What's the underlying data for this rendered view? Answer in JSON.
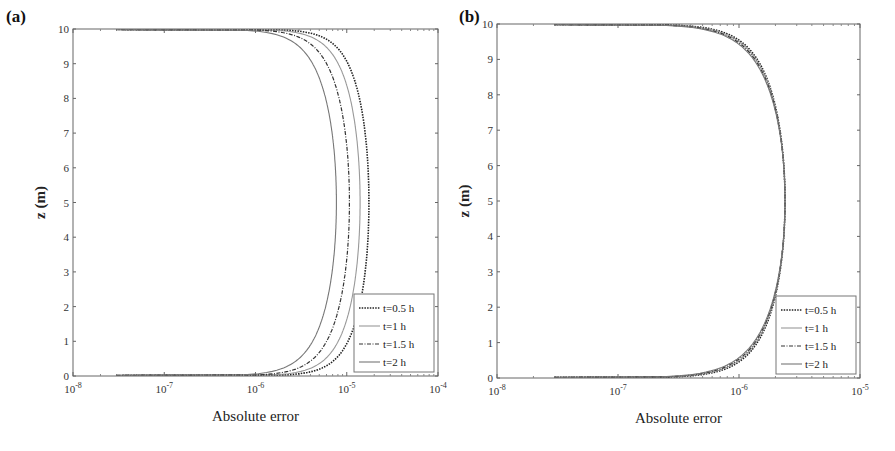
{
  "chart_data": [
    {
      "type": "line",
      "panel_label": "(a)",
      "xlabel": "Absolute error",
      "ylabel": "z (m)",
      "xscale": "log",
      "xlim": [
        1e-08,
        0.0001
      ],
      "ylim": [
        0,
        10
      ],
      "xticks": [
        "10-8",
        "10-7",
        "10-6",
        "10-5",
        "10-4"
      ],
      "yticks": [
        "0",
        "1",
        "2",
        "3",
        "4",
        "5",
        "6",
        "7",
        "8",
        "9",
        "10"
      ],
      "legend_position": "lower right",
      "grid": false,
      "series": [
        {
          "name": "t=0.5 h",
          "style": "dotted",
          "peak_error": 1.75e-05,
          "peak_z": 5
        },
        {
          "name": "t=1 h",
          "style": "solid-light",
          "peak_error": 1.4e-05,
          "peak_z": 5
        },
        {
          "name": "t=1.5 h",
          "style": "dash-dot",
          "peak_error": 1.07e-05,
          "peak_z": 5
        },
        {
          "name": "t=2 h",
          "style": "solid",
          "peak_error": 7.7e-06,
          "peak_z": 5
        }
      ]
    },
    {
      "type": "line",
      "panel_label": "(b)",
      "xlabel": "Absolute error",
      "ylabel": "z (m)",
      "xscale": "log",
      "xlim": [
        1e-08,
        1e-05
      ],
      "ylim": [
        0,
        10
      ],
      "xticks": [
        "10-8",
        "10-7",
        "10-6",
        "10-5"
      ],
      "yticks": [
        "0",
        "1",
        "2",
        "3",
        "4",
        "5",
        "6",
        "7",
        "8",
        "9",
        "10"
      ],
      "legend_position": "lower right",
      "grid": false,
      "series": [
        {
          "name": "t=0.5 h",
          "style": "dotted",
          "peak_error": 2.4e-06,
          "peak_z": 5
        },
        {
          "name": "t=1 h",
          "style": "solid-light",
          "peak_error": 2.4e-06,
          "peak_z": 5
        },
        {
          "name": "t=1.5 h",
          "style": "dash-dot",
          "peak_error": 2.4e-06,
          "peak_z": 5
        },
        {
          "name": "t=2 h",
          "style": "solid",
          "peak_error": 2.4e-06,
          "peak_z": 5
        }
      ]
    }
  ],
  "panels": {
    "a": {
      "label": "(a)",
      "xlabel": "Absolute error",
      "ylabel": "z (m)"
    },
    "b": {
      "label": "(b)",
      "xlabel": "Absolute error",
      "ylabel": "z (m)"
    }
  },
  "legend": [
    "t=0.5 h",
    "t=1 h",
    "t=1.5 h",
    "t=2 h"
  ]
}
